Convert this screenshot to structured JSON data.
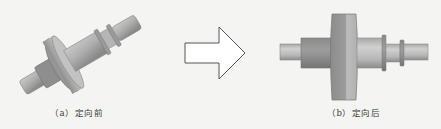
{
  "figure": {
    "panels": [
      {
        "id": "a",
        "caption": "（a）定向前",
        "description": "shaft part, tilted orientation (before orientation)"
      },
      {
        "id": "b",
        "caption": "（b）定向后",
        "description": "shaft part, horizontal orientation (after orientation)"
      }
    ],
    "arrow": {
      "direction": "right",
      "style": "outlined block arrow"
    }
  },
  "colors": {
    "background": "#f4f4f2",
    "part_light": "#c8c8c8",
    "part_mid": "#a9a9a9",
    "part_dark": "#7d7d7d",
    "arrow_stroke": "#555555"
  }
}
